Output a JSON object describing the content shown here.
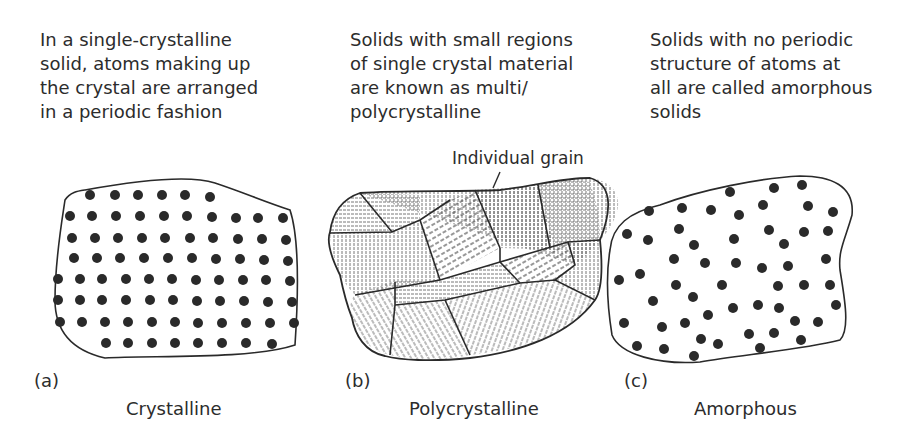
{
  "panels": [
    {
      "id": "a",
      "description": "In a single-crystalline\nsolid, atoms making up\nthe crystal are arranged\nin a periodic fashion",
      "tag": "(a)",
      "caption": "Crystalline"
    },
    {
      "id": "b",
      "description": "Solids with small regions\nof single crystal material\nare known as multi/\npolycrystalline",
      "tag": "(b)",
      "caption": "Polycrystalline",
      "annotation": "Individual grain"
    },
    {
      "id": "c",
      "description": "Solids with no periodic\nstructure of atoms at\nall are called amorphous\nsolids",
      "tag": "(c)",
      "caption": "Amorphous"
    }
  ],
  "colors": {
    "ink": "#2a2a2a",
    "background": "#ffffff"
  }
}
